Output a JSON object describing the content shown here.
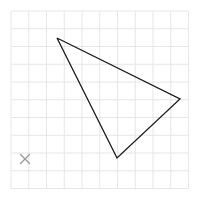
{
  "canvas": {
    "width": 201,
    "height": 198,
    "background_color": "#ffffff",
    "name": "geometry-canvas"
  },
  "grid": {
    "visible": true,
    "line_color": "#e6e6e6",
    "line_width": 1,
    "origin_x": 11,
    "origin_y": 11,
    "cell_size": 17.75,
    "columns": 10,
    "rows": 10,
    "x_lines": [
      11,
      28.75,
      46.5,
      64.25,
      82,
      99.75,
      117.5,
      135.25,
      153,
      170.75,
      188.5
    ],
    "y_lines": [
      11,
      28.75,
      46.5,
      64.25,
      82,
      99.75,
      117.5,
      135.25,
      153,
      170.75,
      188.5
    ]
  },
  "shapes": {
    "triangle": {
      "label": "triangle",
      "stroke_color": "#1a1a1a",
      "stroke_width": 1.3,
      "fill": "none",
      "points": "57,38 180,99 117,158",
      "vertices": [
        {
          "name": "vertex-top-left",
          "x": 57,
          "y": 38
        },
        {
          "name": "vertex-right",
          "x": 180,
          "y": 99
        },
        {
          "name": "vertex-bottom",
          "x": 117,
          "y": 158
        }
      ]
    }
  },
  "markers": {
    "cross": {
      "symbol": "×",
      "color": "#9a9a9a",
      "x": 25,
      "y": 159,
      "size": 9,
      "name": "x-marker"
    }
  }
}
